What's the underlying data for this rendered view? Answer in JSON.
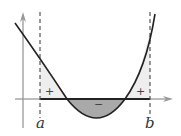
{
  "diagram": {
    "title": "",
    "labels": {
      "a": "a",
      "b": "b",
      "left_sign": "+",
      "middle_sign": "−",
      "right_sign": "+"
    },
    "colors": {
      "positive_fill": "#eeeeee",
      "negative_fill": "#a9a9a9",
      "curve": "#222222",
      "axis": "#999999",
      "dashed": "#555555"
    }
  }
}
